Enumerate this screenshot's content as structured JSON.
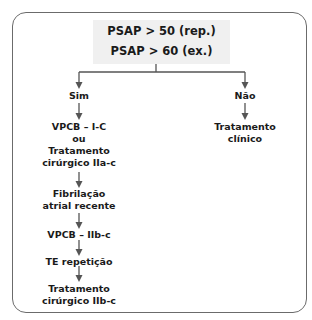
{
  "root": {
    "line1": "PSAP > 50 (rep.)",
    "line2": "PSAP > 60 (ex.)"
  },
  "branches": {
    "yes": {
      "label": "Sim",
      "steps": [
        {
          "lines": [
            "VPCB – I-C",
            "ou",
            "Tratamento",
            "cirúrgico IIa-c"
          ]
        },
        {
          "lines": [
            "Fibrilação",
            "atrial recente"
          ]
        },
        {
          "lines": [
            "VPCB – IIb-c"
          ]
        },
        {
          "lines": [
            "TE repetição"
          ]
        },
        {
          "lines": [
            "Tratamento",
            "cirúrgico IIb-c"
          ]
        }
      ]
    },
    "no": {
      "label": "Não",
      "steps": [
        {
          "lines": [
            "Tratamento",
            "clínico"
          ]
        }
      ]
    }
  },
  "colors": {
    "frame": "#6b6b6b",
    "root_bg": "#f0f0f0",
    "arrow": "#555555",
    "text": "#1a1a1a"
  }
}
